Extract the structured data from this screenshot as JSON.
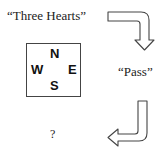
{
  "diagram": {
    "bids": {
      "north": "“Three Hearts”",
      "east": "“Pass”",
      "south": "?"
    },
    "compass": {
      "north": "N",
      "west": "W",
      "east": "E",
      "south": "S"
    },
    "arrows": [
      {
        "name": "arrow-north-to-east",
        "from": "north",
        "to": "east",
        "shape": "right-then-down"
      },
      {
        "name": "arrow-east-to-south",
        "from": "east",
        "to": "south",
        "shape": "down-then-left"
      }
    ],
    "colors": {
      "stroke": "#444444",
      "text": "#222222",
      "background": "#ffffff"
    }
  }
}
